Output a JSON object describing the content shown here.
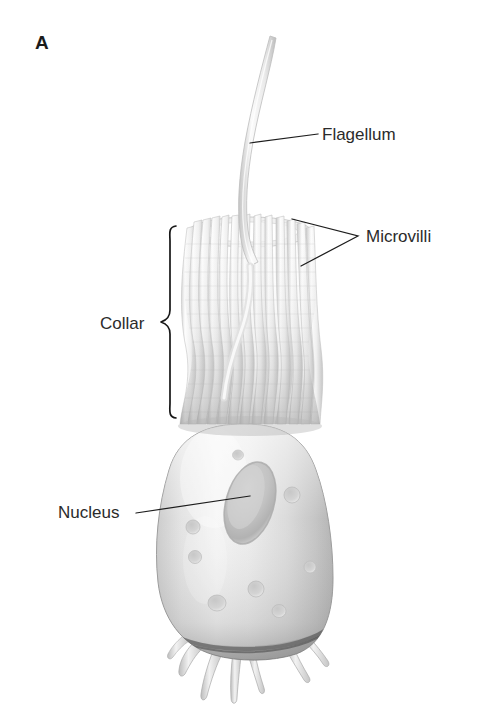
{
  "figure": {
    "panel_letter": "A",
    "background_color": "#ffffff",
    "width": 488,
    "height": 724
  },
  "labels": {
    "flagellum": {
      "text": "Flagellum",
      "x": 322,
      "y": 140,
      "leader_from_x": 318,
      "leader_from_y": 134,
      "leader_to_x": 250,
      "leader_to_y": 143
    },
    "microvilli": {
      "text": "Microvilli",
      "x": 366,
      "y": 242,
      "leader_join_x": 358,
      "leader_join_y": 236,
      "leader_a_x": 292,
      "leader_a_y": 219,
      "leader_b_x": 301,
      "leader_b_y": 266
    },
    "collar": {
      "text": "Collar",
      "x": 100,
      "y": 329,
      "brace_top_y": 226,
      "brace_bottom_y": 418,
      "brace_spine_x": 170,
      "brace_tip_x": 160,
      "brace_mid_y": 322
    },
    "nucleus": {
      "text": "Nucleus",
      "x": 58,
      "y": 518,
      "leader_from_x": 136,
      "leader_from_y": 513,
      "leader_to_x": 250,
      "leader_to_y": 496
    }
  },
  "colors": {
    "label_text": "#2b2b2b",
    "panel_letter": "#1b1b1b",
    "leader_line": "#1d1d1d",
    "brace": "#171717",
    "cell_body_light": "#f2f2f2",
    "cell_body_mid": "#d8d8d8",
    "cell_body_shadow": "#9b9b9b",
    "cell_outline": "#8f8f8f",
    "nucleus_fill": "#c4c4c4",
    "nucleus_rim": "#a8a8a8",
    "microvillus_light": "#fbfbfb",
    "microvillus_shade": "#cfcfcf",
    "flagellum_light": "#fafafa",
    "flagellum_shade": "#c8c8c8",
    "base_shadow": "#5a5a5a"
  },
  "structures": {
    "flagellum": {
      "name": "flagellum",
      "tip_x": 272,
      "tip_y": 38,
      "base_x": 249,
      "base_y": 262,
      "description": "single long tapering whip emerging from centre of collar"
    },
    "collar": {
      "name": "collar",
      "top_y": 216,
      "bottom_y": 428,
      "top_left_x": 187,
      "top_right_x": 312,
      "base_left_x": 180,
      "base_right_x": 320,
      "microvilli_count": 28,
      "description": "cylinder of microvilli, waisted in the middle, flared at base"
    },
    "cell_body": {
      "name": "cell-body",
      "top_y": 424,
      "bottom_y": 660,
      "left_x": 155,
      "right_x": 331,
      "pit_count": 8,
      "description": "ovoid cell body with surface pits and basal shadow"
    },
    "nucleus": {
      "name": "nucleus",
      "center_x": 250,
      "center_y": 503,
      "radius_x": 23,
      "radius_y": 41,
      "rotation_deg": 16
    },
    "pseudopodia": {
      "name": "pseudopodia",
      "count": 6,
      "top_y": 648,
      "bottom_y": 700,
      "description": "short finger-like filopodia at the base of the cell"
    }
  }
}
